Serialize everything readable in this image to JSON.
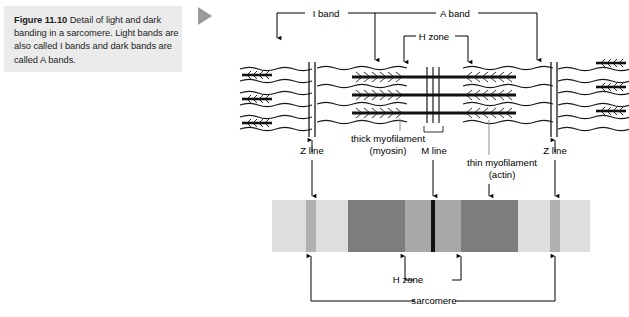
{
  "figure": {
    "number": "Figure 11.10",
    "caption": "Detail of light and dark banding in a sarcomere. Light bands are also called I bands and dark bands are called A bands.",
    "marker_icon": "play-triangle-icon"
  },
  "labels": {
    "i_band": "I band",
    "a_band": "A band",
    "h_zone_top": "H zone",
    "z_line_left": "Z line",
    "z_line_right": "Z line",
    "thick_myofilament": "thick myofilament",
    "thick_myofilament_sub": "(myosin)",
    "m_line": "M line",
    "thin_myofilament": "thin myofilament",
    "thin_myofilament_sub": "(actin)",
    "h_zone_bottom": "H zone",
    "sarcomere": "sarcomere"
  },
  "banding": {
    "x": 272,
    "y": 200,
    "width": 318,
    "height": 52,
    "segments": [
      {
        "name": "i-band-light-left",
        "start": 272,
        "end": 306,
        "color": "#dedede"
      },
      {
        "name": "z-line-stripe-left",
        "start": 306,
        "end": 316,
        "color": "#b0b0b0"
      },
      {
        "name": "i-band-light",
        "start": 316,
        "end": 348,
        "color": "#dedede"
      },
      {
        "name": "a-band-dark-left",
        "start": 348,
        "end": 405,
        "color": "#7d7d7d"
      },
      {
        "name": "h-zone-left",
        "start": 405,
        "end": 431,
        "color": "#a8a8a8"
      },
      {
        "name": "m-line-stripe",
        "start": 431,
        "end": 435,
        "color": "#101010"
      },
      {
        "name": "h-zone-right",
        "start": 435,
        "end": 461,
        "color": "#a8a8a8"
      },
      {
        "name": "a-band-dark-right",
        "start": 461,
        "end": 518,
        "color": "#7d7d7d"
      },
      {
        "name": "i-band-light-r",
        "start": 518,
        "end": 550,
        "color": "#dedede"
      },
      {
        "name": "z-line-stripe-right",
        "start": 550,
        "end": 560,
        "color": "#b0b0b0"
      },
      {
        "name": "i-band-light-far",
        "start": 560,
        "end": 590,
        "color": "#dedede"
      }
    ]
  },
  "colors": {
    "caption_background": "#ebebeb",
    "ink": "#000000",
    "marker_gray": "#9a9a9a",
    "light_band": "#dedede",
    "dark_band": "#7d7d7d",
    "h_zone_band": "#a8a8a8",
    "z_stripe": "#b0b0b0",
    "m_line": "#101010"
  },
  "geometry": {
    "z_line_left_x": 312,
    "z_line_right_x": 555,
    "m_line_x": 433,
    "h_zone_left_x": 405,
    "h_zone_right_x": 461
  }
}
